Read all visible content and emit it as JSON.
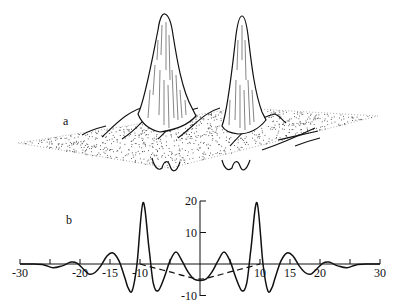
{
  "figure": {
    "panel_a_label": "a",
    "panel_b_label": "b"
  },
  "chart_data": [
    {
      "type": "surface",
      "panel": "a",
      "description": "3D perspective surface plot over a stippled plane with two tall peaks and small ripples/negative dips below the plane",
      "peaks": [
        {
          "name": "left peak",
          "relative_height": 1.0
        },
        {
          "name": "right peak",
          "relative_height": 0.97
        }
      ],
      "grid": false,
      "legend": null
    },
    {
      "type": "line",
      "panel": "b",
      "title": "",
      "xlabel": "",
      "ylabel": "",
      "xlim": [
        -30,
        30
      ],
      "ylim": [
        -10,
        20
      ],
      "x_ticks": [
        -30,
        -25,
        -20,
        -15,
        -10,
        -5,
        0,
        5,
        10,
        15,
        20,
        25,
        30
      ],
      "x_tick_labels": [
        "-30",
        "-20",
        "-15",
        "-10",
        "10",
        "15",
        "20",
        "30"
      ],
      "y_ticks": [
        -10,
        0,
        10,
        20
      ],
      "y_tick_labels": [
        "-10",
        "10",
        "20"
      ],
      "grid": false,
      "legend": null,
      "series": [
        {
          "name": "solid",
          "style": "solid",
          "x": [
            -30,
            -28,
            -26,
            -24.5,
            -23,
            -21.5,
            -20.5,
            -19.5,
            -18.5,
            -17.5,
            -16.5,
            -15.5,
            -14.5,
            -13.5,
            -12.5,
            -12,
            -11.3,
            -10.5,
            -9.5,
            -8.5,
            -7.8,
            -7,
            -6,
            -5,
            -4,
            -3,
            -2,
            -1,
            0,
            1,
            2,
            3,
            4,
            5,
            6,
            7,
            7.8,
            8.5,
            9.5,
            10.5,
            11.3,
            12,
            12.5,
            13.5,
            14.5,
            15.5,
            16.5,
            17.5,
            18.5,
            19.5,
            20.5,
            21.5,
            23,
            24.5,
            26,
            28,
            30
          ],
          "y": [
            0,
            0,
            -0.3,
            -1.2,
            -0.6,
            0.6,
            0.3,
            -1.5,
            -3.2,
            -2.7,
            -0.5,
            2.5,
            3.5,
            1.0,
            -4.5,
            -7.5,
            -8.5,
            0.0,
            19.5,
            5.0,
            -6.0,
            -8.5,
            -4.5,
            1.0,
            3.8,
            1.0,
            -2.5,
            -4.8,
            -5.2,
            -4.8,
            -2.5,
            1.0,
            3.8,
            1.0,
            -4.5,
            -8.5,
            -6.0,
            5.0,
            19.5,
            0.0,
            -8.5,
            -7.5,
            -4.5,
            1.0,
            3.5,
            2.5,
            -0.5,
            -2.7,
            -3.2,
            -1.5,
            0.3,
            0.6,
            -0.6,
            -1.2,
            -0.3,
            0,
            0
          ]
        },
        {
          "name": "dashed",
          "style": "dashed",
          "x": [
            -10,
            -7.5,
            -5,
            -2.5,
            0,
            2.5,
            5,
            7.5,
            10
          ],
          "y": [
            0,
            -1.3,
            -2.5,
            -3.8,
            -4.8,
            -3.8,
            -2.5,
            -1.3,
            0
          ]
        }
      ]
    }
  ]
}
